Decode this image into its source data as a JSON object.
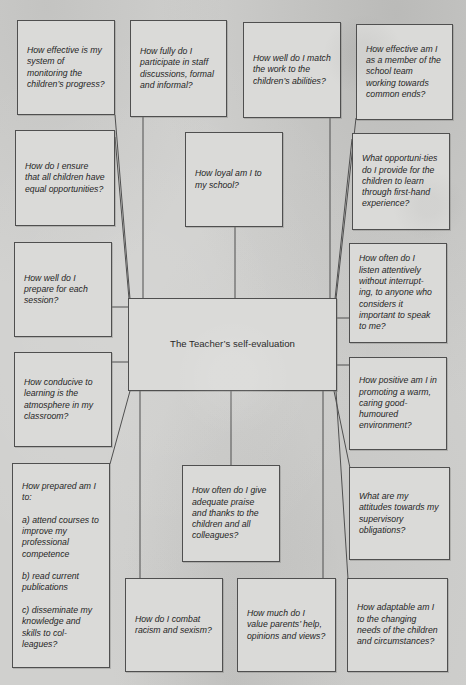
{
  "figure": {
    "title": "The Teacher’s self-evaluation",
    "colors": {
      "page_background": "#d0d0ce",
      "box_fill": "#dadad8",
      "border": "#4f4f4f",
      "text": "#262626"
    },
    "boxes": [
      {
        "id": "center",
        "center": true,
        "text": "The Teacher’s self-evaluation",
        "x": 128,
        "y": 298,
        "w": 209,
        "h": 93
      },
      {
        "id": "monitoring-progress",
        "text": "How effective is my system of monitoring the children’s progress?",
        "x": 17,
        "y": 20,
        "w": 98,
        "h": 95
      },
      {
        "id": "staff-discussions",
        "text": "How fully do I participate in staff discussions, formal and informal?",
        "x": 130,
        "y": 20,
        "w": 97,
        "h": 97
      },
      {
        "id": "match-work",
        "text": "How well do I match the work to the children’s abilities?",
        "x": 243,
        "y": 22,
        "w": 98,
        "h": 96
      },
      {
        "id": "school-team",
        "text": "How effective am I as a member of the school team working towards common ends?",
        "x": 356,
        "y": 24,
        "w": 97,
        "h": 96
      },
      {
        "id": "equal-opportunities",
        "text": "How do I ensure that all children have equal opportunities?",
        "x": 15,
        "y": 130,
        "w": 100,
        "h": 96
      },
      {
        "id": "loyal",
        "text": "How loyal am I to my school?",
        "x": 185,
        "y": 132,
        "w": 98,
        "h": 95
      },
      {
        "id": "first-hand-experience",
        "text": "What opportuni-ties do I provide for the children to learn through first-hand experience?",
        "x": 352,
        "y": 133,
        "w": 98,
        "h": 97
      },
      {
        "id": "prepare-session",
        "text": "How well do I prepare for each session?",
        "x": 14,
        "y": 242,
        "w": 98,
        "h": 95
      },
      {
        "id": "listen-attentively",
        "text": "How often do I listen attentively without interrupt-ing, to anyone who considers it important to speak to me?",
        "x": 349,
        "y": 243,
        "w": 98,
        "h": 100
      },
      {
        "id": "classroom-atmosphere",
        "text": "How conducive to learning is the atmosphere in my classroom?",
        "x": 14,
        "y": 352,
        "w": 98,
        "h": 95
      },
      {
        "id": "positive-environment",
        "text": "How positive am I in promoting a warm, caring good-humoured environment?",
        "x": 349,
        "y": 357,
        "w": 98,
        "h": 93
      },
      {
        "id": "how-prepared",
        "text": "How prepared am I to:\n\na) attend courses to improve my professional competence\n\nb) read current publications\n\nc) disseminate my knowledge and skills to col-leagues?",
        "x": 12,
        "y": 463,
        "w": 98,
        "h": 205
      },
      {
        "id": "praise-thanks",
        "text": "How often do I give adequate praise and thanks to the children and all colleagues?",
        "x": 182,
        "y": 465,
        "w": 98,
        "h": 97
      },
      {
        "id": "supervisory-obligations",
        "text": "What are my attitudes towards my supervisory obligations?",
        "x": 349,
        "y": 467,
        "w": 101,
        "h": 93
      },
      {
        "id": "racism-sexism",
        "text": "How do I combat racism and sexism?",
        "x": 125,
        "y": 578,
        "w": 98,
        "h": 94
      },
      {
        "id": "value-parents",
        "text": "How much do I value parents’ help, opinions and views?",
        "x": 237,
        "y": 578,
        "w": 99,
        "h": 94
      },
      {
        "id": "adaptable",
        "text": "How adaptable am I to the changing needs of the children and circumstances?",
        "x": 347,
        "y": 578,
        "w": 101,
        "h": 94
      }
    ],
    "connectors": [
      [
        115,
        115,
        130,
        299
      ],
      [
        143,
        117,
        143,
        299
      ],
      [
        115,
        137,
        129,
        299
      ],
      [
        235,
        227,
        235,
        299
      ],
      [
        330,
        118,
        330,
        299
      ],
      [
        356,
        118,
        336,
        299
      ],
      [
        352,
        139,
        335,
        299
      ],
      [
        112,
        307,
        129,
        307
      ],
      [
        336,
        318,
        350,
        318
      ],
      [
        112,
        362,
        129,
        362
      ],
      [
        336,
        365,
        350,
        365
      ],
      [
        130,
        391,
        110,
        464
      ],
      [
        140,
        391,
        140,
        579
      ],
      [
        231,
        391,
        231,
        466
      ],
      [
        323,
        391,
        323,
        579
      ],
      [
        334,
        391,
        350,
        468
      ],
      [
        336,
        391,
        348,
        579
      ]
    ]
  }
}
